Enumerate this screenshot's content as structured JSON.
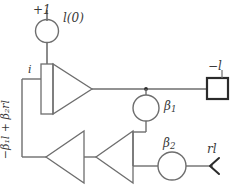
{
  "diagram": {
    "stroke_color": "#6e6e6e",
    "stroke_color_dark": "#2b2b2b",
    "background": "#ffffff",
    "text_color": "#3a3a3a",
    "labels": {
      "initial_condition": "+1",
      "initial_value": "l(0)",
      "integrator_input": "i",
      "output": "−l",
      "gain_one": "β",
      "gain_one_sub": "1",
      "gain_two": "β",
      "gain_two_sub": "2",
      "external_input": "rl",
      "feedback_expression": "−β₁l + β₂rl"
    },
    "blocks": [
      {
        "name": "initial-condition-source",
        "shape": "circle",
        "label": "l(0)"
      },
      {
        "name": "integrator",
        "shape": "triangle-with-bar",
        "label": "i"
      },
      {
        "name": "output-block",
        "shape": "square",
        "label": "−l"
      },
      {
        "name": "beta1-gain",
        "shape": "circle",
        "label": "β₁"
      },
      {
        "name": "beta2-gain",
        "shape": "circle",
        "label": "β₂"
      },
      {
        "name": "inverter-left",
        "shape": "triangle-left",
        "label": ""
      },
      {
        "name": "inverter-right",
        "shape": "triangle-left",
        "label": ""
      },
      {
        "name": "input-arrow",
        "shape": "chevron-left",
        "label": "rl"
      }
    ]
  }
}
